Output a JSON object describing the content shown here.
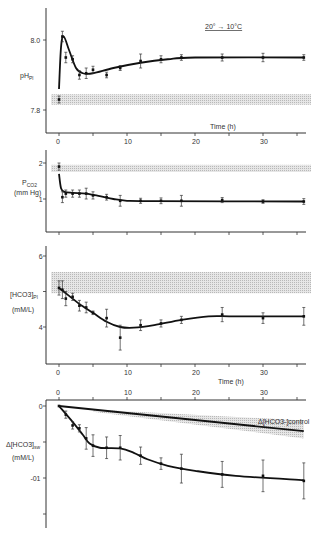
{
  "figure": {
    "annotation": "20° → 10°C",
    "time_label": "Time (h)"
  },
  "chart_data": [
    {
      "type": "line",
      "panel": 1,
      "title": "",
      "annotation": "20° → 10°C",
      "xlabel": "Time (h)",
      "ylabel": "pH_Pl",
      "x_ticks": [
        0,
        10,
        20,
        30
      ],
      "y_ticks": [
        "8.0",
        "7.8"
      ],
      "xlim": [
        -1,
        37
      ],
      "ylim": [
        7.73,
        8.06
      ],
      "control_band": [
        7.815,
        7.845
      ],
      "x": [
        0,
        0.5,
        1,
        2,
        3,
        4,
        5,
        7,
        9,
        12,
        15,
        18,
        24,
        30,
        36
      ],
      "values": [
        7.83,
        8.01,
        7.95,
        7.945,
        7.9,
        7.905,
        7.915,
        7.9,
        7.92,
        7.94,
        7.945,
        7.95,
        7.95,
        7.95,
        7.95
      ],
      "errors": [
        0.01,
        0.015,
        0.015,
        0.01,
        0.012,
        0.015,
        0.01,
        0.008,
        0.007,
        0.02,
        0.01,
        0.008,
        0.01,
        0.012,
        0.008
      ],
      "fit": [
        [
          0,
          7.86
        ],
        [
          0.3,
          7.98
        ],
        [
          0.7,
          8.01
        ],
        [
          1.5,
          7.97
        ],
        [
          2.5,
          7.92
        ],
        [
          3.5,
          7.905
        ],
        [
          5,
          7.905
        ],
        [
          8,
          7.92
        ],
        [
          12,
          7.935
        ],
        [
          16,
          7.945
        ],
        [
          20,
          7.95
        ],
        [
          36,
          7.95
        ]
      ]
    },
    {
      "type": "line",
      "panel": 2,
      "ylabel": "P_CO2 (mm Hg)",
      "y_ticks": [
        "2",
        "1"
      ],
      "ylim": [
        0.1,
        2.2
      ],
      "control_band": [
        1.75,
        1.95
      ],
      "x": [
        0,
        0.5,
        1,
        2,
        3,
        4,
        5,
        7,
        9,
        12,
        15,
        18,
        24,
        30,
        36
      ],
      "values": [
        1.9,
        1.05,
        1.15,
        1.15,
        1.15,
        1.15,
        1.1,
        1.05,
        0.95,
        0.95,
        0.95,
        0.95,
        0.97,
        0.93,
        0.93
      ],
      "errors": [
        0.1,
        0.15,
        0.1,
        0.1,
        0.1,
        0.15,
        0.1,
        0.08,
        0.15,
        0.07,
        0.08,
        0.15,
        0.07,
        0.05,
        0.08
      ],
      "fit": [
        [
          0,
          1.7
        ],
        [
          0.3,
          1.3
        ],
        [
          0.8,
          1.2
        ],
        [
          2,
          1.17
        ],
        [
          4,
          1.15
        ],
        [
          6,
          1.08
        ],
        [
          8,
          1.0
        ],
        [
          10,
          0.95
        ],
        [
          14,
          0.94
        ],
        [
          36,
          0.93
        ]
      ]
    },
    {
      "type": "line",
      "panel": 3,
      "ylabel": "[HCO3-]_Pl (mM/L)",
      "x_ticks": [
        0,
        10,
        20,
        30
      ],
      "y_ticks": [
        "6",
        "5",
        "4"
      ],
      "ylim": [
        3.0,
        6.25
      ],
      "control_band": [
        4.95,
        5.55
      ],
      "x": [
        0,
        0.5,
        1,
        2,
        3,
        4,
        5,
        7,
        9,
        12,
        15,
        18,
        24,
        30,
        36
      ],
      "values": [
        5.1,
        5.05,
        4.8,
        4.85,
        4.6,
        4.55,
        4.4,
        4.25,
        3.7,
        4.05,
        4.1,
        4.2,
        4.35,
        4.25,
        4.3
      ],
      "errors": [
        0.2,
        0.25,
        0.2,
        0.1,
        0.15,
        0.15,
        0.05,
        0.25,
        0.35,
        0.15,
        0.1,
        0.1,
        0.2,
        0.15,
        0.25
      ],
      "fit": [
        [
          0,
          5.1
        ],
        [
          1,
          4.95
        ],
        [
          3,
          4.65
        ],
        [
          5,
          4.4
        ],
        [
          7,
          4.15
        ],
        [
          9,
          4.0
        ],
        [
          11,
          3.98
        ],
        [
          14,
          4.05
        ],
        [
          18,
          4.2
        ],
        [
          22,
          4.3
        ],
        [
          26,
          4.3
        ],
        [
          36,
          4.3
        ]
      ]
    },
    {
      "type": "line",
      "panel": 4,
      "xlabel": "",
      "x_ticks_top": [
        0,
        10,
        20,
        30
      ],
      "ylabel": "Δ[HCO3-]_sw (mM/L)",
      "y_ticks": [
        "0",
        "-01"
      ],
      "ylim": [
        -0.135,
        0.005
      ],
      "annotation": "Δ[HCO3-]control",
      "x": [
        0,
        1,
        2,
        3,
        4,
        5,
        7,
        9,
        12,
        15,
        18,
        24,
        30,
        36
      ],
      "values": [
        0,
        -0.012,
        -0.027,
        -0.031,
        -0.045,
        -0.055,
        -0.058,
        -0.058,
        -0.069,
        -0.08,
        -0.087,
        -0.095,
        -0.097,
        -0.104
      ],
      "errors": [
        0,
        0.005,
        0.005,
        0.005,
        0.015,
        0.015,
        0.015,
        0.017,
        0.012,
        0.008,
        0.02,
        0.018,
        0.022,
        0.025
      ],
      "fit": [
        [
          0,
          0
        ],
        [
          2,
          -0.022
        ],
        [
          3.5,
          -0.04
        ],
        [
          4.5,
          -0.052
        ],
        [
          6,
          -0.058
        ],
        [
          9,
          -0.059
        ],
        [
          11,
          -0.065
        ],
        [
          13,
          -0.074
        ],
        [
          16,
          -0.083
        ],
        [
          20,
          -0.09
        ],
        [
          26,
          -0.097
        ],
        [
          36,
          -0.103
        ]
      ],
      "control_line": [
        [
          0,
          0
        ],
        [
          36,
          -0.035
        ]
      ],
      "control_band": {
        "x": [
          5,
          36
        ],
        "upper": [
          -0.005,
          -0.02
        ],
        "lower": [
          -0.008,
          -0.045
        ]
      }
    }
  ]
}
